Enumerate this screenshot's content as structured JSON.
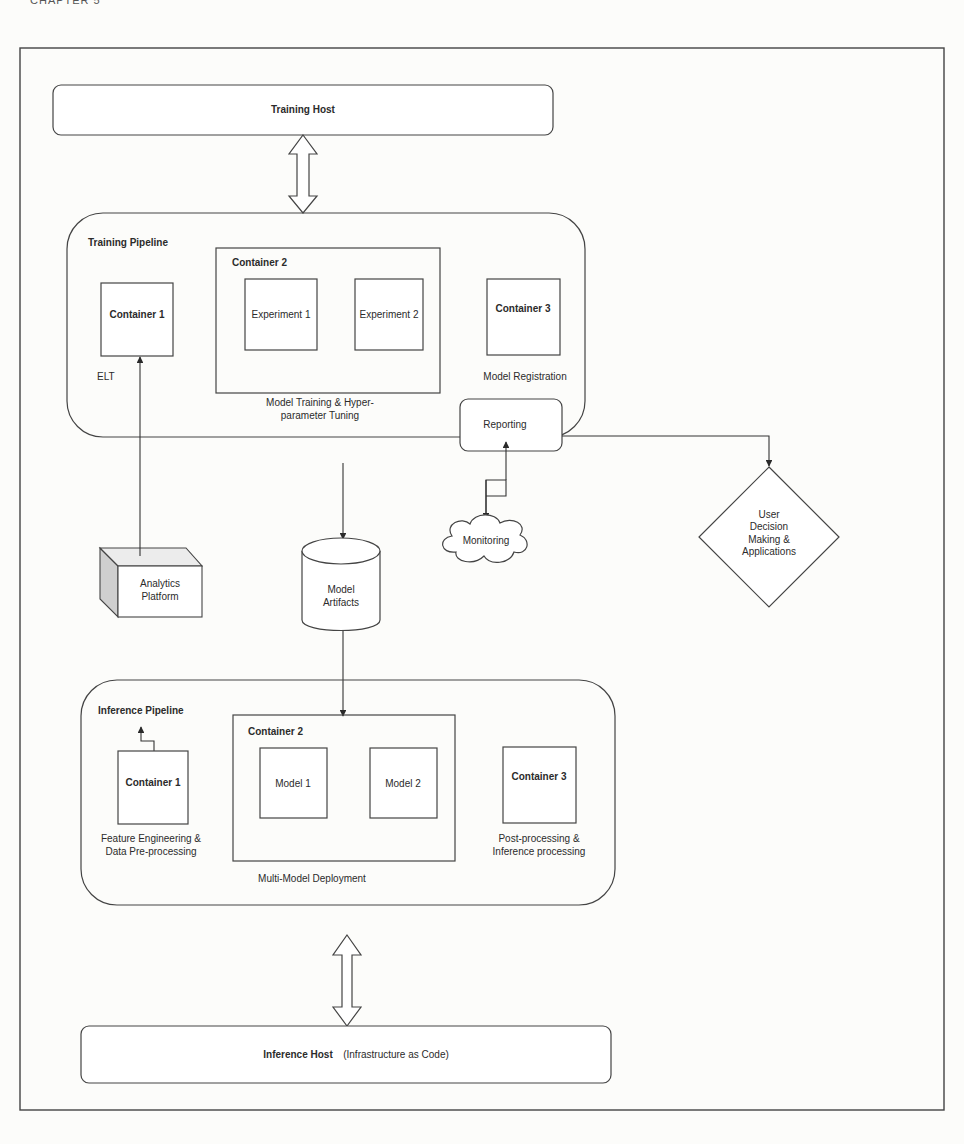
{
  "page": {
    "running_header": "CHAPTER 5"
  },
  "diagram": {
    "training_host": {
      "label": "Training Host"
    },
    "training_pipeline": {
      "title": "Training Pipeline",
      "container_1": {
        "label": "Container 1",
        "caption": "ELT"
      },
      "container_2": {
        "label": "Container 2",
        "items": [
          "Experiment 1",
          "Experiment 2"
        ],
        "caption_line1": "Model Training & Hyper-",
        "caption_line2": "parameter Tuning"
      },
      "container_3": {
        "label": "Container 3",
        "caption": "Model Registration"
      },
      "reporting": {
        "label": "Reporting"
      }
    },
    "user_decision": {
      "lines": [
        "User",
        "Decision",
        "Making &",
        "Applications"
      ]
    },
    "monitoring": {
      "label": "Monitoring"
    },
    "analytics_platform": {
      "lines": [
        "Analytics",
        "Platform"
      ]
    },
    "model_artifacts": {
      "lines": [
        "Model",
        "Artifacts"
      ]
    },
    "inference_pipeline": {
      "title": "Inference Pipeline",
      "container_1": {
        "label": "Container 1",
        "caption_line1": "Feature Engineering &",
        "caption_line2": "Data Pre-processing"
      },
      "container_2": {
        "label": "Container 2",
        "items": [
          "Model 1",
          "Model 2"
        ],
        "caption": "Multi-Model Deployment"
      },
      "container_3": {
        "label": "Container 3",
        "caption_line1": "Post-processing &",
        "caption_line2": "Inference processing"
      }
    },
    "inference_host": {
      "label": "Inference Host",
      "note": "(Infrastructure as Code)"
    }
  }
}
